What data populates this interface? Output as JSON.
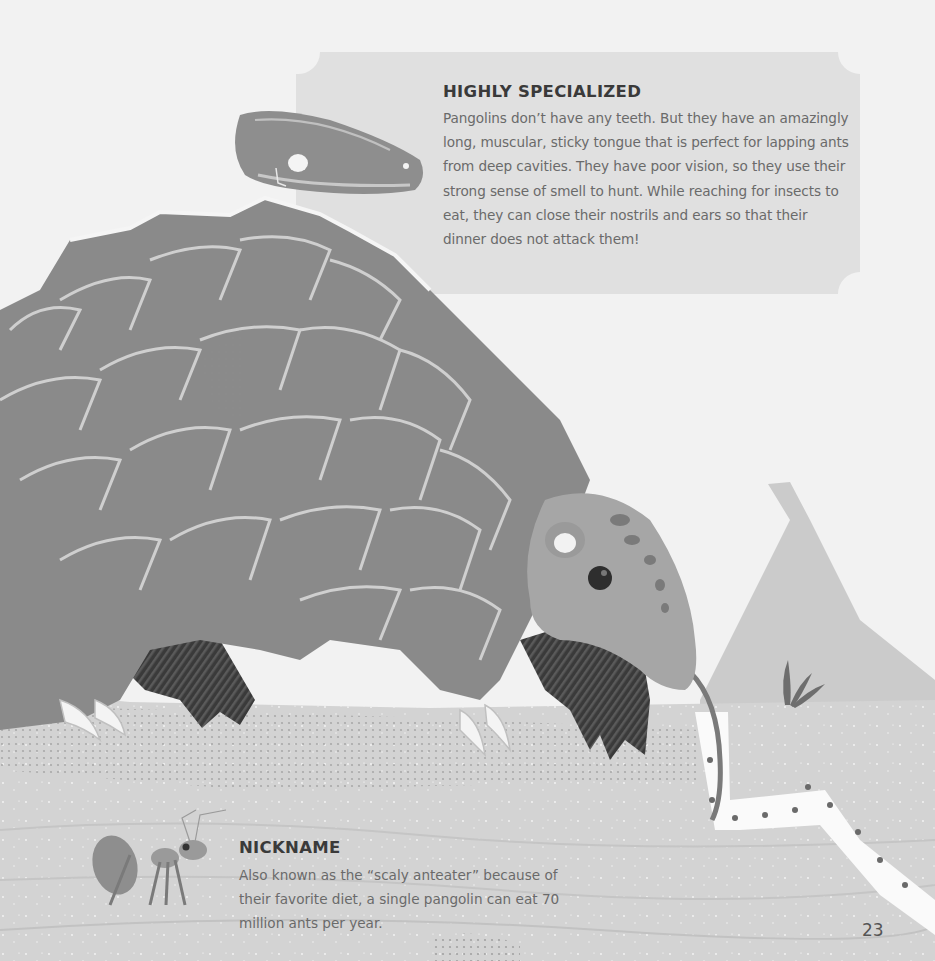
{
  "page": {
    "number": "23",
    "background_color": "#f2f2f2"
  },
  "sections": {
    "highly_specialized": {
      "heading": "HIGHLY SPECIALIZED",
      "body": "Pangolins don’t have any teeth. But they have an amazingly long, muscular, sticky tongue that is perfect for lapping ants from deep cavities. They have poor vision, so they use their strong sense of smell to hunt. While reaching for insects to eat, they can close their nostrils and ears so that their dinner does not attack them!"
    },
    "nickname": {
      "heading": "NICKNAME",
      "body": "Also known as the “scaly anteater” because of their favorite diet, a single pangolin can eat 70 million ants per year."
    }
  },
  "illustration": {
    "subjects": [
      "pangolin",
      "pangolin-skull",
      "ant",
      "ant-trail",
      "mountain",
      "grass-sprout"
    ],
    "colors": {
      "scales": "#8a8a8a",
      "scale_outline": "#c8c8c8",
      "legs": "#3c3c3c",
      "head": "#a8a8a8",
      "ground": "#d2d2d2",
      "mountain": "#cbcbcb",
      "textbox": "#e0e0e0",
      "trail": "#fafafa"
    }
  }
}
